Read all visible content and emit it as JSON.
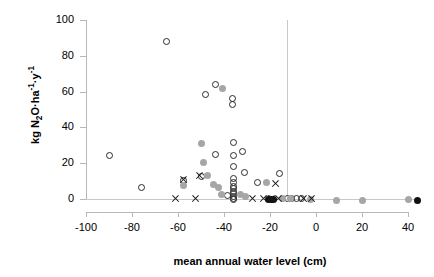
{
  "chart_data": {
    "type": "scatter",
    "title": "",
    "xlabel": "mean annual water level (cm)",
    "ylabel_plain": "kg N2O·ha-1·y-1",
    "ylabel_parts": {
      "prefix": "kg N",
      "sub2": "2",
      "mid": "O·ha",
      "sup1": "-1",
      "mid2": "·y",
      "sup2": "-1"
    },
    "xlim": [
      -105,
      55
    ],
    "ylim": [
      -4,
      100
    ],
    "xticks": [
      -100,
      -80,
      -60,
      -40,
      -20,
      0,
      20,
      40
    ],
    "xtick_labels": [
      "-100",
      "-80",
      "-60",
      "-40",
      "-20",
      "0",
      "20",
      "40"
    ],
    "yticks": [
      0,
      20,
      40,
      60,
      80,
      100
    ],
    "ytick_labels": [
      "0",
      "20",
      "40",
      "60",
      "80",
      "100"
    ],
    "grid": false,
    "legend": "none",
    "reference_lines": [
      {
        "axis": "x",
        "value": 0,
        "color": "#c9c9c9"
      },
      {
        "axis": "y",
        "value": 0,
        "color": "#c9c9c9"
      }
    ],
    "colors": {
      "open_marker_edge": "#2b2b2b",
      "gray_marker_fill": "#a6a6a6",
      "black_marker_fill": "#111111",
      "cross_marker": "#1a1a1a",
      "axis_line": "#b8b8b8"
    },
    "series": [
      {
        "name": "open-circle",
        "marker": "open-circle",
        "points": [
          [
            -90,
            24.5
          ],
          [
            -76,
            6.2
          ],
          [
            -65,
            88.0
          ],
          [
            -57.5,
            10.5
          ],
          [
            -50,
            12.8
          ],
          [
            -48,
            58.5
          ],
          [
            -43.5,
            64.2
          ],
          [
            -43.5,
            24.8
          ],
          [
            -36.5,
            56.0
          ],
          [
            -36.5,
            52.8
          ],
          [
            -36,
            31.8
          ],
          [
            -36,
            24.5
          ],
          [
            -36,
            18.3
          ],
          [
            -36,
            11.2
          ],
          [
            -36,
            9.0
          ],
          [
            -36,
            7.2
          ],
          [
            -36,
            5.6
          ],
          [
            -36,
            4.2
          ],
          [
            -36,
            2.8
          ],
          [
            -36,
            1.5
          ],
          [
            -36,
            0.4
          ],
          [
            -36,
            0.0
          ],
          [
            -38.5,
            2.2
          ],
          [
            -32,
            26.8
          ],
          [
            -31,
            14.6
          ],
          [
            -25.5,
            9.2
          ],
          [
            -16,
            14.2
          ],
          [
            -12.5,
            0.2
          ],
          [
            -10.5,
            0.2
          ],
          [
            -8.5,
            0.2
          ],
          [
            -6.5,
            0.2
          ]
        ]
      },
      {
        "name": "gray-circle",
        "marker": "gray-filled-circle",
        "points": [
          [
            -57.5,
            7.8
          ],
          [
            -50,
            31.2
          ],
          [
            -49,
            20.2
          ],
          [
            -47,
            13.0
          ],
          [
            -44.5,
            8.0
          ],
          [
            -42.5,
            6.2
          ],
          [
            -41,
            2.6
          ],
          [
            -40.5,
            61.8
          ],
          [
            -33,
            2.4
          ],
          [
            -30.5,
            1.6
          ],
          [
            -21.5,
            9.0
          ],
          [
            -20.5,
            0.4
          ],
          [
            -14.5,
            0.2
          ],
          [
            -11,
            0.2
          ],
          [
            -2.5,
            0.0
          ],
          [
            9,
            -0.6
          ],
          [
            20,
            -0.6
          ],
          [
            40,
            -0.4
          ]
        ]
      },
      {
        "name": "black-circle",
        "marker": "black-filled-circle",
        "points": [
          [
            -20.5,
            0.0
          ],
          [
            -19.5,
            0.0
          ],
          [
            -18.5,
            0.0
          ],
          [
            44,
            -0.6
          ]
        ]
      },
      {
        "name": "cross",
        "marker": "x-cross",
        "points": [
          [
            -61,
            0.4
          ],
          [
            -57.5,
            10.8
          ],
          [
            -52.5,
            0.4
          ],
          [
            -50.5,
            13.2
          ],
          [
            -27.5,
            0.2
          ],
          [
            -23,
            0.2
          ],
          [
            -19.5,
            0.2
          ],
          [
            -17.5,
            8.8
          ],
          [
            -16.5,
            0.2
          ],
          [
            -5.5,
            0.2
          ],
          [
            -2.0,
            0.2
          ]
        ]
      }
    ]
  }
}
